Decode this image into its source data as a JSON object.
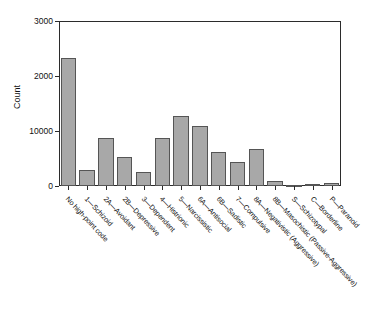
{
  "chart": {
    "type": "bar",
    "title": "",
    "ylabel": "Count",
    "xlabel": "",
    "ytick_labels": [
      "0",
      "10000",
      "2000",
      "3000"
    ],
    "ytick_values": [
      0,
      1000,
      2000,
      3000
    ],
    "ylim": [
      0,
      3000
    ],
    "grid": false,
    "legend": "none",
    "bar_fill": "#a8a8a8",
    "bar_edge": "#555555",
    "axis_color": "#2b2b2b"
  },
  "chart_data": {
    "type": "bar",
    "title": "",
    "xlabel": "",
    "ylabel": "Count",
    "ylim": [
      0,
      3000
    ],
    "grid": false,
    "legend": "none",
    "ytick_labels": [
      "0",
      "10000",
      "2000",
      "3000"
    ],
    "categories": [
      "No high-point code",
      "1—Schizoid",
      "2A—Avoidant",
      "2B—Depressive",
      "3—Dependent",
      "4—Histrionic",
      "5—Narcissistic",
      "6A—Antisocial",
      "6B—Sadistic",
      "7—Compulsive",
      "8A—Negativistic (Aggressive)",
      "8B—Masochistic (Passive-Aggressive)",
      "S—Schizotypal",
      "C—Borderline",
      "P—Paranoid"
    ],
    "values": [
      2330,
      295,
      880,
      520,
      255,
      865,
      1265,
      1095,
      620,
      435,
      665,
      100,
      20,
      40,
      60
    ]
  }
}
